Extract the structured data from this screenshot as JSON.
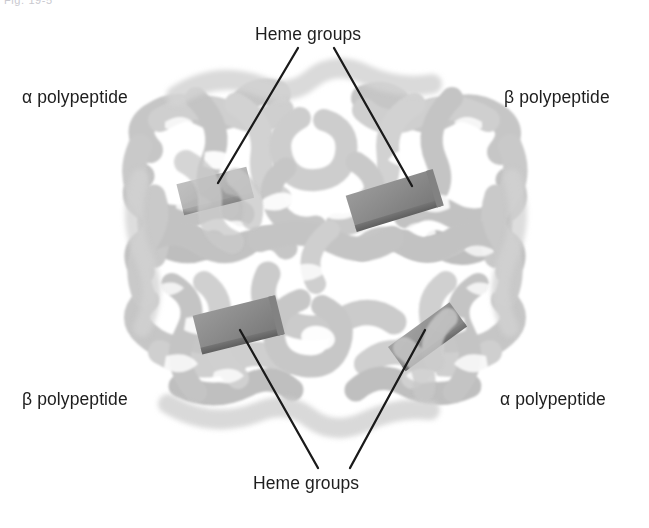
{
  "figure": {
    "number_label": "Fig. 19-5",
    "background_color": "#ffffff",
    "leader_line_color": "#1a1a1a",
    "ribbon_color": "#c9c9c9",
    "ribbon_shadow_color": "#a8a8a8",
    "ribbon_highlight_color": "#dcdcdc",
    "heme_color": "#8f8f8f",
    "heme_edge_color": "#6f6f6f",
    "text_color": "#1d1d1d"
  },
  "labels": {
    "heme_top": "Heme groups",
    "heme_bottom": "Heme groups",
    "alpha_top_left": "α polypeptide",
    "beta_top_right": "β polypeptide",
    "beta_bottom_left": "β polypeptide",
    "alpha_bottom_right": "α polypeptide"
  },
  "diagram_data": {
    "type": "diagram",
    "subunit_count": 4,
    "heme_group_count": 4,
    "subunits": [
      {
        "name": "alpha polypeptide",
        "position": "upper-left",
        "label_side": "left"
      },
      {
        "name": "beta polypeptide",
        "position": "upper-right",
        "label_side": "right"
      },
      {
        "name": "beta polypeptide",
        "position": "lower-left",
        "label_side": "left"
      },
      {
        "name": "alpha polypeptide",
        "position": "lower-right",
        "label_side": "right"
      }
    ],
    "heme_groups": [
      {
        "id": "heme-upper-left",
        "x": 215,
        "y": 190,
        "rotation": -14,
        "label": "Heme groups",
        "label_position": "top"
      },
      {
        "id": "heme-upper-right",
        "x": 393,
        "y": 200,
        "rotation": -17,
        "label": "Heme groups",
        "label_position": "top"
      },
      {
        "id": "heme-lower-left",
        "x": 238,
        "y": 324,
        "rotation": -14,
        "label": "Heme groups",
        "label_position": "bottom"
      },
      {
        "id": "heme-lower-right",
        "x": 427,
        "y": 336,
        "rotation": -36,
        "label": "Heme groups",
        "label_position": "bottom"
      }
    ],
    "leader_lines": [
      {
        "from_label": "heme_top",
        "x1": 298,
        "y1": 48,
        "x2": 218,
        "y2": 183
      },
      {
        "from_label": "heme_top",
        "x1": 334,
        "y1": 48,
        "x2": 412,
        "y2": 186
      },
      {
        "from_label": "heme_bottom",
        "x1": 318,
        "y1": 468,
        "x2": 240,
        "y2": 330
      },
      {
        "from_label": "heme_bottom",
        "x1": 350,
        "y1": 468,
        "x2": 425,
        "y2": 330
      }
    ]
  }
}
